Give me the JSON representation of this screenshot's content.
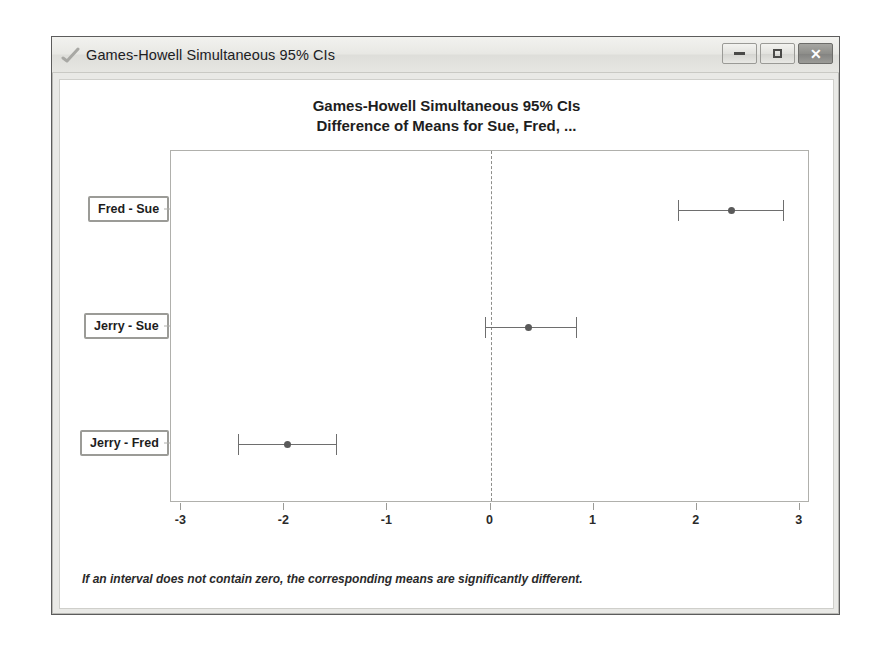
{
  "window": {
    "title": "Games-Howell Simultaneous 95% CIs",
    "icon": "graph-checkmark-icon",
    "controls": {
      "minimize_label": "–",
      "maximize_label": "□",
      "close_label": "✕"
    }
  },
  "chart_data": {
    "type": "scatter",
    "title": "Games-Howell Simultaneous 95% CIs",
    "subtitle": "Difference of Means for Sue, Fred, ...",
    "xlabel": "",
    "ylabel": "",
    "xlim": [
      -3.1,
      3.1
    ],
    "xticks": [
      -3,
      -2,
      -1,
      0,
      1,
      2,
      3
    ],
    "xticklabels": [
      "-3",
      "-2",
      "-1",
      "0",
      "1",
      "2",
      "3"
    ],
    "grid": false,
    "reference_line": 0,
    "reference_line_style": "dashed",
    "categories": [
      "Fred - Sue",
      "Jerry - Sue",
      "Jerry - Fred"
    ],
    "intervals": [
      {
        "label": "Fred - Sue",
        "center": 2.34,
        "lower": 1.82,
        "upper": 2.85
      },
      {
        "label": "Jerry - Sue",
        "center": 0.37,
        "lower": -0.05,
        "upper": 0.84
      },
      {
        "label": "Jerry - Fred",
        "center": -1.97,
        "lower": -2.45,
        "upper": -1.49
      }
    ],
    "footnote": "If an interval does not contain zero, the corresponding means are significantly different."
  },
  "colors": {
    "interval_line": "#6e6e6e",
    "marker": "#5a5a5a",
    "plot_border": "#b0b0ac",
    "reference_line": "#8d8d8a",
    "label_box_border": "#9b9b97",
    "window_chrome": "#e9e9e6"
  }
}
